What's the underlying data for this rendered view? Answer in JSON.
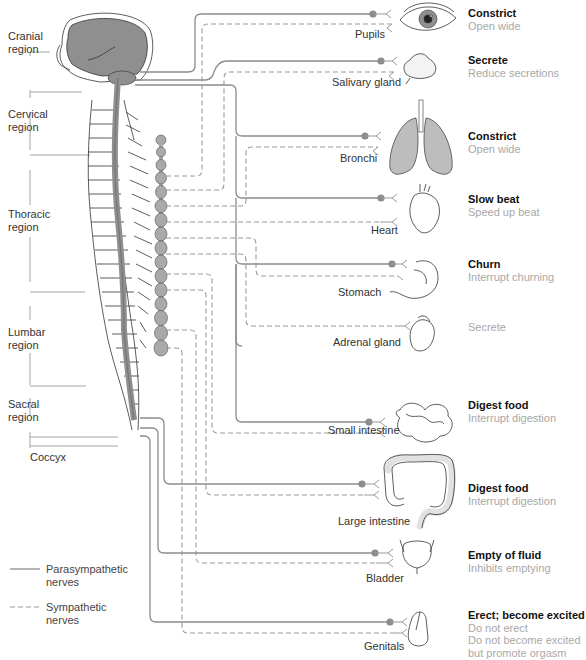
{
  "diagram": {
    "colors": {
      "nerve": "#8c8c8c",
      "cns_fill": "#8f8f8f",
      "ganglion_fill": "#a9a9a9",
      "outline": "#333333",
      "sympathetic_effect_text": "#a8a8a8",
      "parasympathetic_effect_text": "#111111"
    }
  },
  "regions": [
    {
      "label": "Cranial\nregion"
    },
    {
      "label": "Cervical\nregion"
    },
    {
      "label": "Thoracic\nregion"
    },
    {
      "label": "Lumbar\nregion"
    },
    {
      "label": "Sacral\nregion"
    },
    {
      "label": "Coccyx"
    }
  ],
  "organs": [
    {
      "name": "Pupils",
      "icon": "eye-icon",
      "parasympathetic": "Constrict",
      "sympathetic": "Open wide"
    },
    {
      "name": "Salivary gland",
      "icon": "salivary-gland-icon",
      "parasympathetic": "Secrete",
      "sympathetic": "Reduce secretions"
    },
    {
      "name": "Bronchi",
      "icon": "lungs-icon",
      "parasympathetic": "Constrict",
      "sympathetic": "Open wide"
    },
    {
      "name": "Heart",
      "icon": "heart-icon",
      "parasympathetic": "Slow beat",
      "sympathetic": "Speed up beat"
    },
    {
      "name": "Stomach",
      "icon": "stomach-icon",
      "parasympathetic": "Churn",
      "sympathetic": "Interrupt churning"
    },
    {
      "name": "Adrenal gland",
      "icon": "adrenal-gland-icon",
      "parasympathetic": "",
      "sympathetic": "Secrete"
    },
    {
      "name": "Small intestine",
      "icon": "small-intestine-icon",
      "parasympathetic": "Digest food",
      "sympathetic": "Interrupt digestion"
    },
    {
      "name": "Large intestine",
      "icon": "large-intestine-icon",
      "parasympathetic": "Digest food",
      "sympathetic": "Interrupt digestion"
    },
    {
      "name": "Bladder",
      "icon": "bladder-icon",
      "parasympathetic": "Empty of fluid",
      "sympathetic": "Inhibits emptying"
    },
    {
      "name": "Genitals",
      "icon": "genitals-icon",
      "parasympathetic": "Erect; become excited",
      "sympathetic": "Do not erect\nDo not become excited\nbut promote orgasm"
    }
  ],
  "legend": {
    "parasympathetic": "Parasympathetic\nnerves",
    "sympathetic": "Sympathetic\nnerves"
  }
}
